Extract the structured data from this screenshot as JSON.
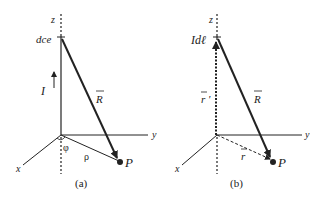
{
  "figure_a": {
    "caption": "(a)",
    "axis_labels": {
      "z": "z",
      "y": "y",
      "x": "x"
    },
    "element_label": "dce",
    "current_label": "I",
    "vector_R": "R",
    "angle_label": "φ",
    "radius_label": "ρ",
    "point_label": "P"
  },
  "figure_b": {
    "caption": "(b)",
    "axis_labels": {
      "z": "z",
      "y": "y",
      "x": "x"
    },
    "element_label": "Idℓ",
    "vector_r_prime": "r '",
    "vector_R": "R",
    "vector_r": "r",
    "point_label": "P"
  },
  "colors": {
    "line": "#222222",
    "background": "#ffffff"
  }
}
